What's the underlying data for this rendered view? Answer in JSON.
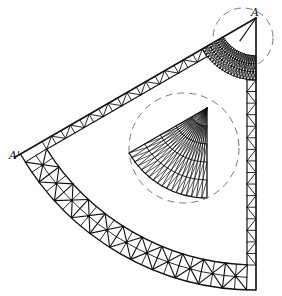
{
  "diagram": {
    "stroke_color": "#111111",
    "dash_color": "#777777",
    "background": "#ffffff",
    "apex": {
      "x": 256,
      "y": 18
    },
    "sector": {
      "start_angle_deg": 90,
      "end_angle_deg": 150,
      "outer_radius": 272
    },
    "outer_band": {
      "outer_radius": 272,
      "inner_radius": 247,
      "segments": 11
    },
    "edge_band_right": {
      "width": 9,
      "from_radius": 62,
      "to_radius": 247,
      "panels": 16
    },
    "edge_band_left": {
      "width": 9,
      "from_radius": 62,
      "to_radius": 247,
      "panels": 17
    },
    "apex_band": {
      "outer_radius": 62,
      "inner_radius": 38,
      "segments": 10,
      "rings": 3
    },
    "inner_fan": {
      "apex": {
        "x": 207,
        "y": 108
      },
      "radius": 90,
      "start_angle_deg": 90,
      "end_angle_deg": 150,
      "spokes": 18,
      "rings": 5
    },
    "detail_circles": [
      {
        "name": "apex-detail-circle",
        "cx": 243,
        "cy": 38,
        "r": 30
      },
      {
        "name": "fan-detail-circle",
        "cx": 184,
        "cy": 148,
        "r": 55
      }
    ],
    "labels": [
      {
        "id": "label-a",
        "text": "A",
        "x": 251,
        "y": 16
      },
      {
        "id": "label-a-prime",
        "text": "A'",
        "x": 9,
        "y": 159
      }
    ]
  }
}
